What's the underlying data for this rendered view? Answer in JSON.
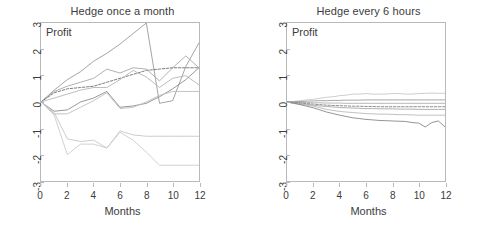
{
  "figure": {
    "width": 491,
    "height": 235,
    "background": "#ffffff",
    "axis_color": "#b9b9b9",
    "text_color": "#3c3c3c"
  },
  "chart_data": [
    {
      "type": "line",
      "panel_id": "hedge-once-a-month",
      "title": "Hedge once a month",
      "xlabel": "Months",
      "ylabel": "Profit",
      "inner_label": "Profit",
      "xlim": [
        0,
        12
      ],
      "ylim": [
        -3,
        3
      ],
      "xticks": [
        0,
        2,
        4,
        6,
        8,
        10,
        12
      ],
      "xticklabels": [
        "0",
        "2",
        "4",
        "6",
        "8",
        "10",
        "12"
      ],
      "yticks": [
        -3,
        -2,
        -1,
        0,
        1,
        2,
        3
      ],
      "yticklabels": [
        "-3",
        "-2",
        "-1",
        "0",
        "1",
        "2",
        "3"
      ],
      "grid": false,
      "legend": "none",
      "x": [
        0,
        1,
        2,
        3,
        4,
        5,
        6,
        7,
        8,
        9,
        10,
        11,
        12
      ],
      "series": [
        {
          "name": "path-1",
          "style": "solid",
          "color": "#9a9a9a",
          "width": 0.9,
          "values": [
            0.0,
            0.45,
            0.85,
            1.15,
            1.55,
            1.85,
            2.2,
            2.6,
            3.0,
            -0.05,
            0.05,
            1.35,
            2.25
          ]
        },
        {
          "name": "path-2",
          "style": "solid",
          "color": "#a8a8a8",
          "width": 0.9,
          "values": [
            0.0,
            0.4,
            0.6,
            0.75,
            0.9,
            1.25,
            1.1,
            1.3,
            1.25,
            0.8,
            1.3,
            1.75,
            1.3
          ]
        },
        {
          "name": "path-3",
          "style": "dashed",
          "color": "#6e6e6e",
          "width": 0.9,
          "values": [
            0.0,
            0.35,
            0.5,
            0.55,
            0.6,
            0.75,
            0.9,
            1.05,
            1.2,
            1.25,
            1.3,
            1.3,
            1.3
          ]
        },
        {
          "name": "path-4",
          "style": "solid",
          "color": "#b5b5b5",
          "width": 0.9,
          "values": [
            0.0,
            0.15,
            0.3,
            0.45,
            0.55,
            0.55,
            0.85,
            1.2,
            0.95,
            0.55,
            0.9,
            1.0,
            0.65
          ]
        },
        {
          "name": "path-5",
          "style": "solid",
          "color": "#8c8c8c",
          "width": 0.9,
          "values": [
            0.0,
            -0.35,
            -0.3,
            0.0,
            0.15,
            0.4,
            -0.2,
            -0.15,
            -0.05,
            0.2,
            0.5,
            0.85,
            1.3
          ]
        },
        {
          "name": "path-6",
          "style": "solid",
          "color": "#bdbdbd",
          "width": 0.9,
          "values": [
            0.0,
            -0.45,
            -0.45,
            -0.2,
            0.05,
            0.35,
            -0.25,
            -0.2,
            0.0,
            0.25,
            0.4,
            0.4,
            0.4
          ]
        },
        {
          "name": "path-7",
          "style": "solid",
          "color": "#c6c6c6",
          "width": 0.9,
          "values": [
            0.0,
            -0.4,
            -1.4,
            -1.5,
            -1.45,
            -1.75,
            -1.1,
            -1.25,
            -1.3,
            -1.3,
            -1.3,
            -1.3,
            -1.3
          ]
        },
        {
          "name": "path-8",
          "style": "solid",
          "color": "#cccccc",
          "width": 0.9,
          "values": [
            0.0,
            -0.5,
            -2.0,
            -1.6,
            -1.6,
            -1.75,
            -1.15,
            -1.45,
            -1.9,
            -2.4,
            -2.4,
            -2.4,
            -2.4
          ]
        }
      ]
    },
    {
      "type": "line",
      "panel_id": "hedge-every-6-hours",
      "title": "Hedge every 6 hours",
      "xlabel": "Months",
      "ylabel": "Profit",
      "inner_label": "Profit",
      "xlim": [
        0,
        12
      ],
      "ylim": [
        -3,
        3
      ],
      "xticks": [
        0,
        2,
        4,
        6,
        8,
        10,
        12
      ],
      "xticklabels": [
        "0",
        "2",
        "4",
        "6",
        "8",
        "10",
        "12"
      ],
      "yticks": [
        -3,
        -2,
        -1,
        0,
        1,
        2,
        3
      ],
      "yticklabels": [
        "-3",
        "-2",
        "-1",
        "0",
        "1",
        "2",
        "3"
      ],
      "grid": false,
      "legend": "none",
      "x": [
        0,
        0.5,
        1,
        1.5,
        2,
        2.5,
        3,
        3.5,
        4,
        4.5,
        5,
        5.5,
        6,
        6.5,
        7,
        7.5,
        8,
        8.5,
        9,
        9.5,
        10,
        10.5,
        11,
        11.5,
        12
      ],
      "series": [
        {
          "name": "path-1",
          "style": "solid",
          "color": "#c2c2c2",
          "width": 0.8,
          "values": [
            0.0,
            0.02,
            0.05,
            0.08,
            0.1,
            0.14,
            0.18,
            0.2,
            0.24,
            0.26,
            0.3,
            0.3,
            0.32,
            0.3,
            0.3,
            0.3,
            0.32,
            0.32,
            0.3,
            0.3,
            0.32,
            0.33,
            0.34,
            0.33,
            0.33
          ]
        },
        {
          "name": "path-2",
          "style": "solid",
          "color": "#8f8f8f",
          "width": 0.8,
          "values": [
            0.0,
            0.01,
            0.02,
            0.03,
            0.04,
            0.05,
            0.05,
            0.06,
            0.06,
            0.07,
            0.07,
            0.07,
            0.08,
            0.08,
            0.08,
            0.08,
            0.08,
            0.08,
            0.08,
            0.08,
            0.08,
            0.08,
            0.08,
            0.08,
            0.08
          ]
        },
        {
          "name": "path-3",
          "style": "solid",
          "color": "#a5a5a5",
          "width": 0.8,
          "values": [
            0.0,
            -0.01,
            -0.02,
            -0.02,
            -0.03,
            -0.03,
            -0.04,
            -0.04,
            -0.04,
            -0.05,
            -0.05,
            -0.05,
            -0.05,
            -0.05,
            -0.05,
            -0.05,
            -0.05,
            -0.05,
            -0.05,
            -0.05,
            -0.05,
            -0.05,
            -0.05,
            -0.05,
            -0.05
          ]
        },
        {
          "name": "path-4",
          "style": "dashed",
          "color": "#707070",
          "width": 0.8,
          "values": [
            0.0,
            -0.02,
            -0.04,
            -0.06,
            -0.08,
            -0.1,
            -0.12,
            -0.13,
            -0.14,
            -0.15,
            -0.16,
            -0.16,
            -0.17,
            -0.17,
            -0.18,
            -0.18,
            -0.18,
            -0.18,
            -0.18,
            -0.18,
            -0.18,
            -0.18,
            -0.18,
            -0.18,
            -0.18
          ]
        },
        {
          "name": "path-5",
          "style": "solid",
          "color": "#9c9c9c",
          "width": 0.8,
          "values": [
            0.0,
            -0.03,
            -0.06,
            -0.09,
            -0.12,
            -0.15,
            -0.17,
            -0.19,
            -0.21,
            -0.22,
            -0.23,
            -0.24,
            -0.25,
            -0.25,
            -0.26,
            -0.26,
            -0.26,
            -0.27,
            -0.27,
            -0.27,
            -0.28,
            -0.28,
            -0.28,
            -0.28,
            -0.28
          ]
        },
        {
          "name": "path-6",
          "style": "solid",
          "color": "#b0b0b0",
          "width": 0.8,
          "values": [
            0.0,
            -0.04,
            -0.08,
            -0.12,
            -0.16,
            -0.22,
            -0.28,
            -0.32,
            -0.36,
            -0.38,
            -0.4,
            -0.42,
            -0.44,
            -0.45,
            -0.46,
            -0.46,
            -0.47,
            -0.48,
            -0.48,
            -0.49,
            -0.5,
            -0.5,
            -0.5,
            -0.5,
            -0.5
          ]
        },
        {
          "name": "path-7",
          "style": "solid",
          "color": "#787878",
          "width": 0.8,
          "values": [
            0.0,
            -0.05,
            -0.1,
            -0.16,
            -0.22,
            -0.3,
            -0.38,
            -0.44,
            -0.5,
            -0.55,
            -0.6,
            -0.63,
            -0.66,
            -0.68,
            -0.7,
            -0.71,
            -0.72,
            -0.73,
            -0.74,
            -0.78,
            -0.8,
            -0.95,
            -0.78,
            -0.72,
            -0.95
          ]
        }
      ]
    }
  ]
}
